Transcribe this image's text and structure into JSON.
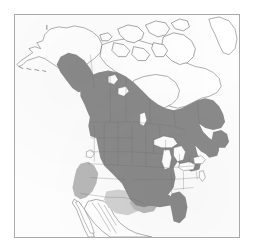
{
  "figure": {
    "kind": "range-distribution-map",
    "region": "North America",
    "caption_text": "",
    "title_text": "",
    "has_legend": false,
    "has_title": false,
    "has_axis_labels": false,
    "has_scale_bar": false,
    "has_north_arrow": false,
    "visible_text": "",
    "accessible_description": "Black and white printed range map of North America. A medium gray tint covers the contiguous United States, southern and central Canada, the southern Alaska coast and panhandle, Newfoundland and the Maritime provinces. A lighter gray tint covers parts of the southwestern United States and adjacent northern Mexico. The Canadian Arctic islands, Hudson Bay, the Great Lakes, northern Alaska, the Aleutian chain and most of Mexico including Baja California are unshaded."
  },
  "colors": {
    "page_background": "#ffffff",
    "plate_background": "#fdfdfd",
    "frame_border": "#a9a9a9",
    "range_primary_fill": "#8a8a8a",
    "range_secondary_fill": "#b8b8b8",
    "range_tertiary_fill": "#d2d2d2",
    "coastline_stroke": "#6f6f6f",
    "internal_boundary_stroke": "#6e6e6e",
    "water_fill": "#ffffff",
    "arctic_detail_stroke": "#5f5f5f"
  },
  "frame": {
    "left": 14,
    "top": 14,
    "width": 226,
    "height": 224,
    "border_width": 1
  },
  "map_layers": [
    {
      "id": "landmass-outline",
      "label": "North America coastline and political outline",
      "stroke": "#6f6f6f",
      "fill": "#ffffff",
      "interactable": false
    },
    {
      "id": "range-primary",
      "label": "Primary range shading (medium gray)",
      "fill": "#8a8a8a",
      "interactable": false
    },
    {
      "id": "range-secondary",
      "label": "Secondary range shading (light gray)",
      "fill": "#b8b8b8",
      "interactable": false
    },
    {
      "id": "internal-boundaries",
      "label": "State and provincial boundaries",
      "stroke": "#6e6e6e",
      "interactable": false
    },
    {
      "id": "water-bodies",
      "label": "Great Lakes, Hudson Bay and coastal waters",
      "fill": "#ffffff",
      "interactable": false
    }
  ],
  "range_regions": {
    "shaded_primary": [
      "Contiguous United States",
      "Southern Canada",
      "Central Canada",
      "South-central Alaska",
      "Alaska panhandle",
      "Newfoundland",
      "Maritime provinces",
      "Florida"
    ],
    "shaded_secondary": [
      "Southwestern United States",
      "Northern Mexico"
    ],
    "unshaded": [
      "Canadian Arctic Archipelago",
      "Hudson Bay",
      "Great Lakes",
      "Northern Alaska",
      "Seward Peninsula",
      "Aleutian Islands",
      "Baja California",
      "Central and southern Mexico",
      "Greenland margin"
    ]
  },
  "marks": [
    {
      "id": "small-island-tick",
      "label": "Small island tick mark near northwest Alaska",
      "x": 32,
      "y": 12,
      "interactable": false
    }
  ]
}
